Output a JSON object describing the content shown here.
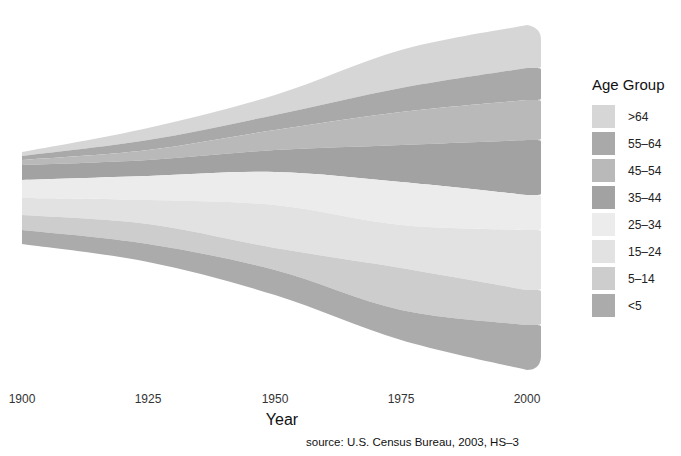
{
  "chart_data": {
    "type": "area",
    "subtype": "streamgraph",
    "title": "",
    "xlabel": "Year",
    "ylabel": "",
    "x": [
      1900,
      1925,
      1950,
      1975,
      2000
    ],
    "x_ticks": [
      "1900",
      "1925",
      "1950",
      "1975",
      "2000"
    ],
    "xlim": [
      1900,
      2003
    ],
    "grid": false,
    "legend_position": "right",
    "legend_title": "Age Group",
    "series": [
      {
        "name": ">64",
        "values": [
          3,
          9,
          14,
          22,
          29
        ],
        "color": "#d6d6d6"
      },
      {
        "name": "55-64",
        "values": [
          3,
          7,
          11,
          15,
          22
        ],
        "color": "#a9a9a9"
      },
      {
        "name": "45-54",
        "values": [
          4,
          8,
          14,
          22,
          28
        ],
        "color": "#b9b9b9"
      },
      {
        "name": "35-44",
        "values": [
          12,
          12,
          16,
          25,
          45
        ],
        "color": "#a2a2a2"
      },
      {
        "name": "25-34",
        "values": [
          14,
          18,
          24,
          30,
          27
        ],
        "color": "#ececec"
      },
      {
        "name": "15-24",
        "values": [
          14,
          18,
          22,
          29,
          36
        ],
        "color": "#e2e2e2"
      },
      {
        "name": "5-14",
        "values": [
          11,
          15,
          17,
          29,
          29
        ],
        "color": "#cdcdcd"
      },
      {
        "name": "<5",
        "values": [
          10,
          13,
          18,
          21,
          32
        ],
        "color": "#ababab"
      }
    ],
    "annotations": [
      "source: U.S. Census Bureau, 2003, HS-3"
    ]
  },
  "axis": {
    "ticks": [
      "1900",
      "1925",
      "1950",
      "1975",
      "2000"
    ],
    "xlabel": "Year"
  },
  "legend": {
    "title": "Age Group",
    "items": [
      {
        "label": ">64",
        "color": "#d6d6d6"
      },
      {
        "label": "55–64",
        "color": "#a9a9a9"
      },
      {
        "label": "45–54",
        "color": "#b9b9b9"
      },
      {
        "label": "35–44",
        "color": "#a2a2a2"
      },
      {
        "label": "25–34",
        "color": "#ececec"
      },
      {
        "label": "15–24",
        "color": "#e2e2e2"
      },
      {
        "label": "5–14",
        "color": "#cdcdcd"
      },
      {
        "label": "<5",
        "color": "#ababab"
      }
    ]
  },
  "source": "source: U.S. Census Bureau, 2003, HS–3",
  "layout": {
    "x_pixels": [
      22,
      148,
      275,
      401,
      527
    ],
    "end_x": 541,
    "boundaries": [
      [
        152,
        128,
        95,
        50,
        25
      ],
      [
        156,
        140,
        115,
        88,
        68
      ],
      [
        160,
        150,
        130,
        112,
        100
      ],
      [
        165,
        160,
        150,
        145,
        140
      ],
      [
        180,
        176,
        172,
        182,
        195
      ],
      [
        198,
        200,
        205,
        225,
        230
      ],
      [
        215,
        224,
        248,
        268,
        290
      ],
      [
        230,
        244,
        270,
        310,
        325
      ],
      [
        244,
        262,
        295,
        340,
        370
      ]
    ]
  }
}
